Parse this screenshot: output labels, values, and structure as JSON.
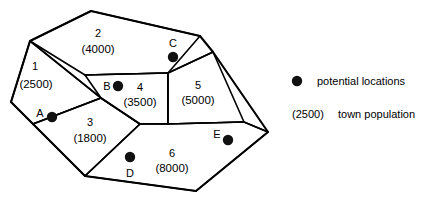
{
  "figure": {
    "type": "territory-map-diagram",
    "background_color": "#ffffff",
    "ink_color": "#000000"
  },
  "map": {
    "regions": [
      {
        "id": "1",
        "label": "1",
        "population": "(2500)",
        "label_x": 35,
        "label_y": 66,
        "pop_x": 36,
        "pop_y": 85
      },
      {
        "id": "2",
        "label": "2",
        "population": "(4000)",
        "label_x": 98,
        "label_y": 33,
        "pop_x": 98,
        "pop_y": 50
      },
      {
        "id": "3",
        "label": "3",
        "population": "(1800)",
        "label_x": 90,
        "label_y": 122,
        "pop_x": 90,
        "pop_y": 139
      },
      {
        "id": "4",
        "label": "4",
        "population": "(3500)",
        "label_x": 140,
        "label_y": 87,
        "pop_x": 140,
        "pop_y": 103
      },
      {
        "id": "5",
        "label": "5",
        "population": "(5000)",
        "label_x": 198,
        "label_y": 85,
        "pop_x": 198,
        "pop_y": 101
      },
      {
        "id": "6",
        "label": "6",
        "population": "(8000)",
        "label_x": 172,
        "label_y": 153,
        "pop_x": 172,
        "pop_y": 169
      }
    ],
    "sites": [
      {
        "id": "A",
        "label": "A",
        "dot_x": 52,
        "dot_y": 117,
        "label_x": 40,
        "label_y": 113
      },
      {
        "id": "B",
        "label": "B",
        "dot_x": 118,
        "dot_y": 86,
        "label_x": 107,
        "label_y": 86
      },
      {
        "id": "C",
        "label": "C",
        "dot_x": 173,
        "dot_y": 57,
        "label_x": 173,
        "label_y": 43
      },
      {
        "id": "D",
        "label": "D",
        "dot_x": 130,
        "dot_y": 157,
        "label_x": 130,
        "label_y": 173
      },
      {
        "id": "E",
        "label": "E",
        "dot_x": 228,
        "dot_y": 140,
        "label_x": 217,
        "label_y": 134
      }
    ],
    "outline_points": "91,11 200,36 213,52 268,132 196,191 85,176 11,102 30,41",
    "region_paths": {
      "r1": "M30,41 L11,102 L33,124 L101,98 Z",
      "r2": "M30,41 L91,11 L200,36 L168,73 L85,75 Z",
      "r3": "M33,124 L101,98 L140,124 L85,176 Z",
      "r4": "M85,75 L168,73 L168,124 L140,124 L101,98 Z",
      "r5": "M168,73 L213,52 L244,122 L168,124 Z",
      "r6": "M140,124 L168,124 L244,122 L268,132 L196,191 L85,176 Z"
    },
    "divider_paths": [
      "M30,41 L101,98",
      "M33,124 L101,98",
      "M85,75 L168,73",
      "M101,98 L140,124",
      "M140,124 L85,176",
      "M168,73 L168,124",
      "M168,73 L213,52",
      "M140,124 L168,124 L244,122 L268,132"
    ],
    "site_dot_radius": 5.2
  },
  "legend": {
    "entries": [
      {
        "kind": "dot",
        "symbol": "filled-circle",
        "text": "potential locations",
        "dot_x": 297,
        "dot_y": 81,
        "text_x": 317,
        "text_y": 81
      },
      {
        "kind": "value",
        "symbol": "(2500)",
        "text": "town population",
        "symbol_x": 292,
        "symbol_y": 114,
        "text_x": 338,
        "text_y": 114
      }
    ],
    "dot_radius": 5.2
  }
}
